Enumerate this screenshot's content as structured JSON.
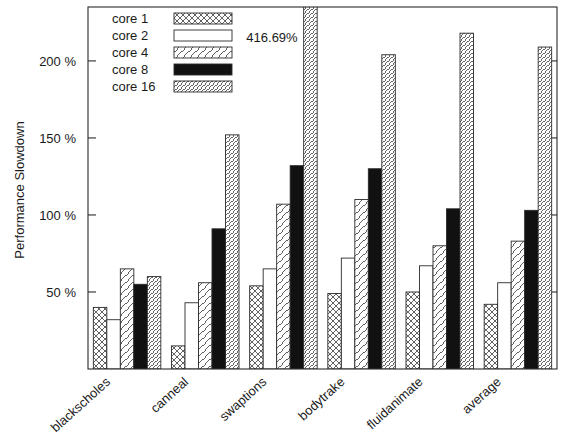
{
  "chart_data": {
    "type": "bar",
    "title": "",
    "xlabel": "",
    "ylabel": "Performance Slowdown",
    "categories": [
      "blackscholes",
      "canneal",
      "swaptions",
      "bodytrake",
      "fluidanimate",
      "average"
    ],
    "series": [
      {
        "name": "core 1",
        "pattern": "crosshatch",
        "values": [
          40,
          15,
          54,
          49,
          50,
          42
        ]
      },
      {
        "name": "core 2",
        "pattern": "empty",
        "values": [
          32,
          43,
          65,
          72,
          67,
          56
        ]
      },
      {
        "name": "core 4",
        "pattern": "diagonal-sparse",
        "values": [
          65,
          56,
          107,
          110,
          80,
          83
        ]
      },
      {
        "name": "core 8",
        "pattern": "solid",
        "values": [
          55,
          91,
          132,
          130,
          104,
          103
        ]
      },
      {
        "name": "core 16",
        "pattern": "diagonal-dense",
        "values": [
          60,
          152,
          416.69,
          204,
          218,
          209
        ]
      }
    ],
    "ylim": [
      0,
      235
    ],
    "yticks": [
      50,
      100,
      150,
      200
    ],
    "ytick_labels": [
      "50 %",
      "100 %",
      "150 %",
      "200 %"
    ],
    "grid": false,
    "legend_position": "top-left",
    "annotations": [
      {
        "text": "416.69%",
        "series": "core 16",
        "category": "swaptions",
        "value": 416.69
      }
    ],
    "units": "percent",
    "clipped_bars": [
      {
        "series": "core 16",
        "category": "swaptions",
        "value": 416.69
      }
    ]
  },
  "colors": {
    "axis": "#2b2b2b",
    "text": "#1a1a1a",
    "bar_fill_solid": "#111111",
    "bar_fill_empty": "#ffffff",
    "background": "#ffffff"
  }
}
